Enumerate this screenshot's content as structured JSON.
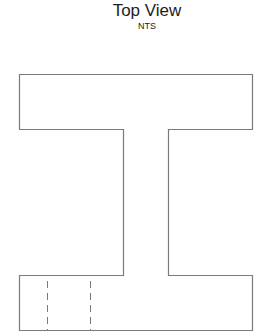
{
  "title": "Top View",
  "subtitle": "NTS",
  "colors": {
    "outline": "#7a7a7a",
    "hidden_line": "#7a7a7a",
    "text": "#222222",
    "background": "#ffffff"
  },
  "shape": {
    "type": "I-section outline (top view)",
    "top_flange": {
      "x1": 19.5,
      "y1": 74.5,
      "x2": 252.5,
      "y2": 129.5
    },
    "web": {
      "x1": 123.5,
      "x2": 168.5,
      "y1": 129.5,
      "y2": 275.5
    },
    "bottom_flange": {
      "x1": 19.5,
      "y1": 275.5,
      "x2": 252.5,
      "y2": 330.5
    }
  },
  "hidden_lines": [
    {
      "x": 47.5,
      "y1": 281,
      "y2": 330
    },
    {
      "x": 90.5,
      "y1": 281,
      "y2": 330
    }
  ]
}
